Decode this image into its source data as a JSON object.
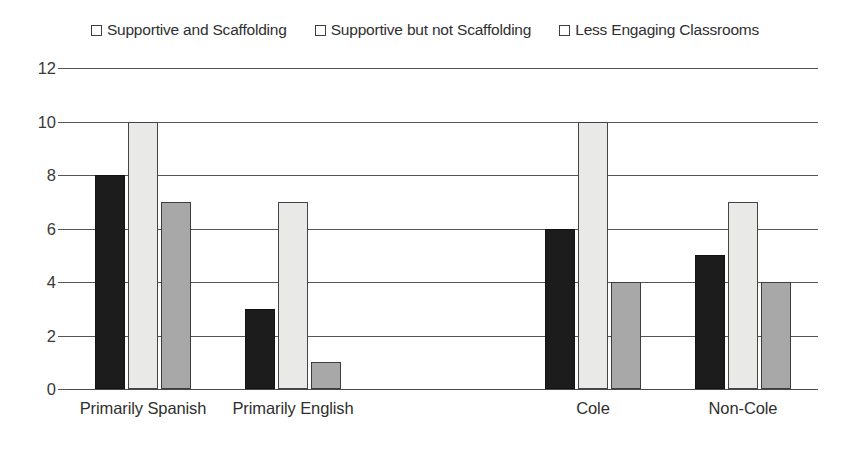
{
  "chart_data": {
    "type": "bar",
    "title": "",
    "subtitle": "",
    "xlabel": "",
    "ylabel": "",
    "ylim": [
      0,
      12
    ],
    "yticks": [
      0,
      2,
      4,
      6,
      8,
      10,
      12
    ],
    "grid": true,
    "legend_position": "top-center",
    "categories": [
      "Primarily Spanish",
      "Primarily English",
      "",
      "Cole",
      "Non-Cole"
    ],
    "series": [
      {
        "name": "Supportive and Scaffolding",
        "color": "#1c1c1c",
        "swatch": "black-square-icon",
        "values": [
          8,
          3,
          0,
          6,
          5
        ]
      },
      {
        "name": "Supportive but not Scaffolding",
        "color": "#e9e9e7",
        "swatch": "white-square-icon",
        "values": [
          10,
          7,
          0,
          10,
          7
        ]
      },
      {
        "name": "Less Engaging Classrooms",
        "color": "#a8a8a8",
        "swatch": "gray-square-icon",
        "values": [
          7,
          1,
          0,
          4,
          4
        ]
      }
    ]
  }
}
